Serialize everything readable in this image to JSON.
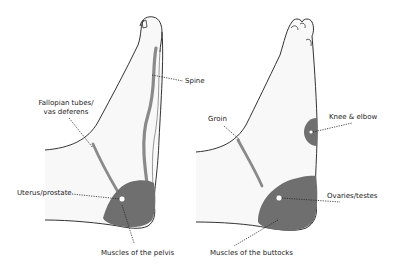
{
  "colors": {
    "outline": "#333333",
    "zone": "#6f6f6f",
    "channel": "#8a8a8a",
    "skin": "#f7f7f7",
    "leader": "#222222"
  },
  "left_foot": {
    "description": "Medial (inner) side of foot",
    "labels": {
      "spine": "Spine",
      "fallopian_line1": "Fallopian tubes/",
      "fallopian_line2": "vas deferens",
      "uterus": "Uterus/prostate",
      "pelvis_muscles": "Muscles of the pelvis"
    }
  },
  "right_foot": {
    "description": "Lateral (outer) side of foot",
    "labels": {
      "groin": "Groin",
      "knee_elbow": "Knee & elbow",
      "ovaries": "Ovaries/testes",
      "buttocks_muscles": "Muscles of the buttocks"
    }
  }
}
